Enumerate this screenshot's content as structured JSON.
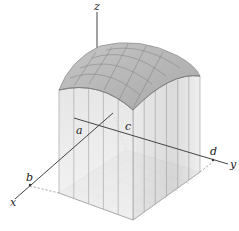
{
  "figure": {
    "axes": {
      "x_label": "x",
      "y_label": "y",
      "z_label": "z"
    },
    "bounds": {
      "a": "a",
      "b": "b",
      "c": "c",
      "d": "d"
    },
    "grid": {
      "x_subdivisions": 5,
      "y_subdivisions": 6
    },
    "colors": {
      "box_fill": "#d8d8d8",
      "top_fill": "#b4b4b4",
      "edge": "#888888",
      "axis": "#333333",
      "background": "#ffffff"
    }
  }
}
